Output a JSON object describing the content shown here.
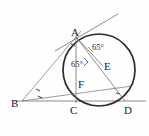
{
  "figure": {
    "type": "geometry-diagram",
    "background_color": "#fefefe",
    "stroke_color": "#3a3a3a",
    "circle_color": "#2b2b2b",
    "label_color": "#1c1c1c"
  },
  "points": [
    {
      "id": "A",
      "label": "A",
      "x": 76,
      "y": 37,
      "label_x": 72,
      "label_y": 34
    },
    {
      "id": "B",
      "label": "B",
      "x": 22,
      "y": 101,
      "label_x": 14,
      "label_y": 105
    },
    {
      "id": "C",
      "label": "C",
      "x": 76,
      "y": 101,
      "label_x": 71,
      "label_y": 113
    },
    {
      "id": "D",
      "label": "D",
      "x": 125,
      "y": 101,
      "label_x": 126,
      "label_y": 113
    },
    {
      "id": "E",
      "label": "E",
      "x": 101,
      "y": 64,
      "label_x": 104,
      "label_y": 68
    },
    {
      "id": "F",
      "label": "F",
      "x": 82,
      "y": 79,
      "label_x": 79,
      "label_y": 87
    }
  ],
  "circle": {
    "center_x": 99,
    "center_y": 70,
    "radius": 36
  },
  "angles": [
    {
      "id": "angle-upper",
      "value": "65",
      "symbol": "°",
      "text": "65°",
      "x": 94,
      "y": 48,
      "at_vertex": "A",
      "between": "AE-AB"
    },
    {
      "id": "angle-lower",
      "value": "65",
      "symbol": "°",
      "text": "65°",
      "x": 79,
      "y": 64,
      "at_vertex": "A",
      "between": "AF-AC"
    }
  ],
  "segments": [
    {
      "id": "tangent-line",
      "name": "tangent-at-A",
      "x1": 55,
      "y1": 51,
      "x2": 117,
      "y2": 15
    },
    {
      "id": "base-line",
      "name": "line-BCD",
      "x1": 14,
      "y1": 101,
      "x2": 146,
      "y2": 101
    },
    {
      "id": "line-BA",
      "name": "segment-B-to-A",
      "x1": 22,
      "y1": 101,
      "x2": 80,
      "y2": 32
    },
    {
      "id": "line-BE",
      "name": "segment-B-to-E",
      "x1": 22,
      "y1": 101,
      "x2": 131,
      "y2": 86
    },
    {
      "id": "line-AC",
      "name": "segment-A-to-C",
      "x1": 76,
      "y1": 37,
      "x2": 76,
      "y2": 101
    },
    {
      "id": "line-AD",
      "name": "segment-A-to-D",
      "x1": 76,
      "y1": 37,
      "x2": 125,
      "y2": 101
    },
    {
      "id": "line-AE",
      "name": "segment-A-to-E",
      "x1": 76,
      "y1": 37,
      "x2": 101,
      "y2": 64
    }
  ],
  "tick_marks": [
    {
      "id": "tick-B-upper",
      "x": 38,
      "y": 91
    },
    {
      "id": "tick-B-lower",
      "x": 40,
      "y": 97
    },
    {
      "id": "tick-A",
      "x": 73,
      "y": 45
    },
    {
      "id": "tick-D",
      "x": 118,
      "y": 94
    }
  ],
  "right_angle_marks": [
    {
      "id": "right-angle-F",
      "x": 85,
      "y": 62
    }
  ]
}
